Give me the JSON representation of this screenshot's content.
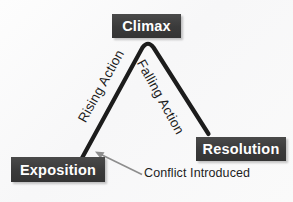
{
  "diagram": {
    "background_color": "#fbfbfb",
    "box_color": "#3b3b3b",
    "box_text_color": "#ffffff",
    "arc_color": "#1d1d1d",
    "callout_color": "#8d8d8d"
  },
  "boxes": {
    "climax": "Climax",
    "exposition": "Exposition",
    "resolution": "Resolution"
  },
  "arc_labels": {
    "rising": "Rising Action",
    "falling": "Falling Action"
  },
  "callout": {
    "conflict": "Conflict Introduced"
  }
}
